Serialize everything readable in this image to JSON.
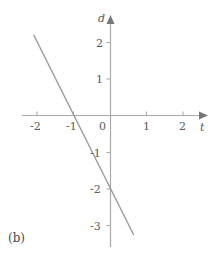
{
  "panel": {
    "label": "(b)"
  },
  "axes": {
    "x_name": "t",
    "y_name": "d",
    "x_ticks": [
      "-2",
      "-1",
      "0",
      "1",
      "2"
    ],
    "y_ticks": [
      "2",
      "1",
      "-1",
      "-2",
      "-3"
    ],
    "axis_color": "#aaaaaa",
    "text_color": "#5a5a5a"
  },
  "chart_data": {
    "type": "line",
    "title": "",
    "subtitle": "",
    "xlabel": "t",
    "ylabel": "d",
    "xlim": [
      -2.6,
      2.6
    ],
    "ylim": [
      -3.7,
      2.6
    ],
    "xticks": [
      -2,
      -1,
      0,
      1,
      2
    ],
    "yticks": [
      2,
      1,
      -1,
      -2,
      -3
    ],
    "xtick_labels": [
      "−2",
      "−1",
      "0",
      "1",
      "2"
    ],
    "ytick_labels": [
      "2",
      "1",
      "−1",
      "−2",
      "−3"
    ],
    "grid": false,
    "legend": "none",
    "annotations": [
      "(b)"
    ],
    "series": [
      {
        "name": "d = -2t - 2",
        "color": "#999999",
        "slope": -2,
        "intercept": -2,
        "x": [
          -2.1,
          0.63
        ],
        "y": [
          2.2,
          -3.26
        ],
        "points": [
          {
            "x": -2.1,
            "y": 2.2
          },
          {
            "x": -1.0,
            "y": 0.0
          },
          {
            "x": 0.0,
            "y": -2.0
          },
          {
            "x": 0.63,
            "y": -3.26
          }
        ],
        "x_intercept": -1,
        "y_intercept": -2
      }
    ]
  }
}
